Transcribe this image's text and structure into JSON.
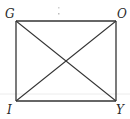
{
  "diagram": {
    "type": "rectangle-with-diagonals",
    "vertices": {
      "top_left": {
        "label": "G",
        "x": 16,
        "y": 21
      },
      "top_right": {
        "label": "O",
        "x": 116,
        "y": 21
      },
      "bottom_left": {
        "label": "I",
        "x": 16,
        "y": 101
      },
      "bottom_right": {
        "label": "Y",
        "x": 116,
        "y": 101
      }
    },
    "edges": [
      "GO",
      "OY",
      "YI",
      "IG"
    ],
    "diagonals": [
      "GY",
      "OI"
    ],
    "intersection": {
      "x": 66,
      "y": 61
    },
    "colors": {
      "stroke": "#333333",
      "label": "#2a2a2a",
      "background": "#ffffff",
      "artifact": "#e4e4e4"
    }
  }
}
